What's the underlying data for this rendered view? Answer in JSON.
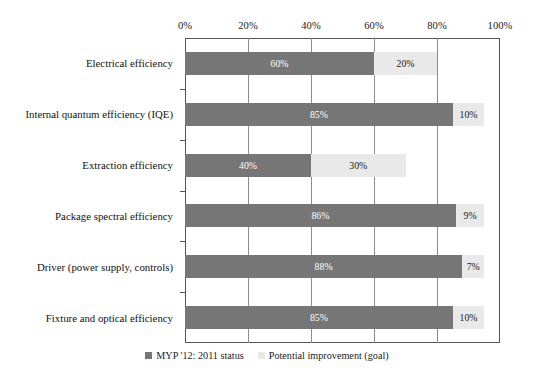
{
  "chart_data": {
    "type": "bar",
    "orientation": "horizontal",
    "stacked": true,
    "title": "",
    "subtitle": "",
    "xlabel": "",
    "ylabel": "",
    "xlim": [
      0,
      100
    ],
    "xticks": [
      0,
      20,
      40,
      60,
      80,
      100
    ],
    "xtick_labels": [
      "0%",
      "20%",
      "40%",
      "60%",
      "80%",
      "100%"
    ],
    "grid": "vertical",
    "axis_position": "top",
    "legend_position": "bottom-center",
    "categories": [
      "Electrical efficiency",
      "Internal quantum efficiency (IQE)",
      "Extraction efficiency",
      "Package spectral efficiency",
      "Driver (power supply, controls)",
      "Fixture and optical efficiency"
    ],
    "series": [
      {
        "name": "MYP '12: 2011 status",
        "color": "#767676",
        "values": [
          60,
          85,
          40,
          86,
          88,
          85
        ],
        "labels": [
          "60%",
          "85%",
          "40%",
          "86%",
          "88%",
          "85%"
        ]
      },
      {
        "name": "Potential improvement (goal)",
        "color": "#e9e9e9",
        "values": [
          20,
          10,
          30,
          9,
          7,
          10
        ],
        "labels": [
          "20%",
          "10%",
          "30%",
          "9%",
          "7%",
          "10%"
        ]
      }
    ]
  },
  "legend": {
    "items": [
      {
        "label": "MYP '12: 2011 status",
        "swatch": "status"
      },
      {
        "label": "Potential improvement (goal)",
        "swatch": "goal"
      }
    ]
  },
  "colors": {
    "status": "#767676",
    "goal": "#e9e9e9",
    "axis": "#555555",
    "grid": "#8d8d8d",
    "text": "#111111",
    "background": "#ffffff"
  }
}
